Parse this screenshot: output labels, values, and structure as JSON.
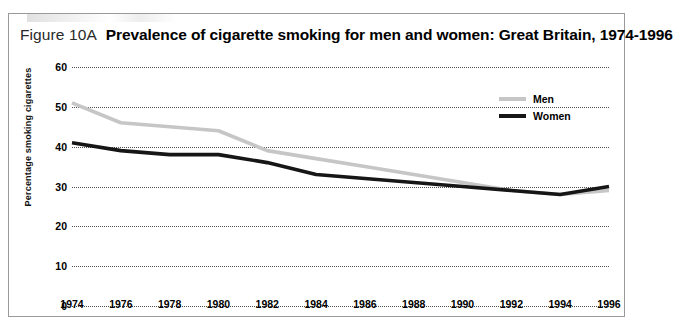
{
  "figure": {
    "number_label": "Figure 10A",
    "title": "Prevalence of cigarette smoking for men and women: Great Britain, 1974-1996"
  },
  "legend": {
    "position": "top-right",
    "entries": [
      {
        "label": "Men",
        "color": "#c6c6c6"
      },
      {
        "label": "Women",
        "color": "#161616"
      }
    ]
  },
  "axes": {
    "y_label": "Percentage smoking cigarettes",
    "y_ticks": [
      "0",
      "10",
      "20",
      "30",
      "40",
      "50",
      "60"
    ],
    "x_ticks": [
      "1974",
      "1976",
      "1978",
      "1980",
      "1982",
      "1984",
      "1986",
      "1988",
      "1990",
      "1992",
      "1994",
      "1996"
    ]
  },
  "chart_data": {
    "type": "line",
    "title": "Prevalence of cigarette smoking for men and women: Great Britain, 1974-1996",
    "xlabel": "",
    "ylabel": "Percentage smoking cigarettes",
    "x": [
      1974,
      1976,
      1978,
      1980,
      1982,
      1984,
      1986,
      1988,
      1990,
      1992,
      1994,
      1996
    ],
    "categories": [
      "1974",
      "1976",
      "1978",
      "1980",
      "1982",
      "1984",
      "1986",
      "1988",
      "1990",
      "1992",
      "1994",
      "1996"
    ],
    "series": [
      {
        "name": "Men",
        "color": "#c6c6c6",
        "values": [
          51,
          46,
          45,
          44,
          39,
          37,
          35,
          33,
          31,
          29,
          28,
          29
        ]
      },
      {
        "name": "Women",
        "color": "#161616",
        "values": [
          41,
          39,
          38,
          38,
          36,
          33,
          32,
          31,
          30,
          29,
          28,
          30
        ]
      }
    ],
    "ylim": [
      0,
      60
    ],
    "ytick_step": 10,
    "xlim": [
      1974,
      1996
    ],
    "xtick_step": 2,
    "grid": "horizontal-dotted",
    "legend_position": "top-right"
  }
}
